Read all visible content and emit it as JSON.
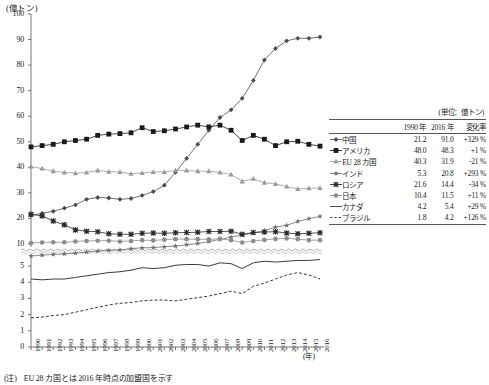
{
  "axis": {
    "unit_top": "(億トン)",
    "unit_year": "(年)",
    "y_main_ticks": [
      100,
      90,
      80,
      70,
      60,
      50,
      40,
      30,
      20,
      10
    ],
    "y_lower_ticks": [
      5,
      4,
      3,
      2,
      1,
      0
    ],
    "x_ticks": [
      "1990",
      "1991",
      "1992",
      "1993",
      "1994",
      "1995",
      "1996",
      "1997",
      "1998",
      "1999",
      "2000",
      "2001",
      "2002",
      "2003",
      "2004",
      "2005",
      "2006",
      "2007",
      "2008",
      "2009",
      "2010",
      "2011",
      "2012",
      "2013",
      "2014",
      "2015",
      "2016"
    ]
  },
  "footnote": {
    "mark": "(注)",
    "text": "EU 28 カ国とは 2016 年時点の加盟国を示す"
  },
  "legend": {
    "unit": "(単位：億トン)",
    "headers": [
      "",
      "",
      "1990 年",
      "2016 年",
      "変化率"
    ],
    "rows": [
      {
        "marker": "diamond",
        "name": "中国",
        "v1990": "21.2",
        "v2016": "91.0",
        "change": "+329 %"
      },
      {
        "marker": "square",
        "name": "アメリカ",
        "v1990": "48.0",
        "v2016": "48.3",
        "change": "+1 %"
      },
      {
        "marker": "triangle",
        "name": "EU 28 カ国",
        "v1990": "40.3",
        "v2016": "31.9",
        "change": "-21 %"
      },
      {
        "marker": "star",
        "name": "インド",
        "v1990": "5.3",
        "v2016": "20.8",
        "change": "+293 %"
      },
      {
        "marker": "cross",
        "name": "ロシア",
        "v1990": "21.6",
        "v2016": "14.4",
        "change": "-34 %"
      },
      {
        "marker": "circle",
        "name": "日本",
        "v1990": "10.4",
        "v2016": "11.5",
        "change": "+11 %"
      },
      {
        "marker": "solid",
        "name": "カナダ",
        "v1990": "4.2",
        "v2016": "5.4",
        "change": "+29 %"
      },
      {
        "marker": "dashed",
        "name": "ブラジル",
        "v1990": "1.8",
        "v2016": "4.2",
        "change": "+126 %"
      }
    ]
  },
  "colors": {
    "axis": "#555555",
    "china": "#4d4d4d",
    "usa": "#1a1a1a",
    "eu": "#9a9a9a",
    "india": "#6e6e6e",
    "russia": "#2b2b2b",
    "japan": "#8c8c8c",
    "canada": "#3a3a3a",
    "brazil": "#3a3a3a"
  },
  "chart_data": {
    "type": "line",
    "title": "",
    "xlabel": "(年)",
    "ylabel": "(億トン)",
    "ylim_main": [
      10,
      100
    ],
    "ylim_lower": [
      0,
      5.5
    ],
    "axis_break": true,
    "grid": false,
    "legend_position": "right",
    "x": [
      1990,
      1991,
      1992,
      1993,
      1994,
      1995,
      1996,
      1997,
      1998,
      1999,
      2000,
      2001,
      2002,
      2003,
      2004,
      2005,
      2006,
      2007,
      2008,
      2009,
      2010,
      2011,
      2012,
      2013,
      2014,
      2015,
      2016
    ],
    "series": [
      {
        "name": "中国",
        "marker": "diamond",
        "panel": "main",
        "values": [
          21.2,
          22.0,
          22.8,
          24.0,
          25.3,
          27.5,
          28.2,
          28.0,
          27.5,
          27.8,
          29.0,
          30.5,
          33.0,
          38.0,
          43.5,
          49.0,
          54.5,
          59.5,
          62.5,
          67.0,
          74.0,
          82.0,
          86.5,
          89.5,
          90.5,
          90.5,
          91.0
        ]
      },
      {
        "name": "アメリカ",
        "marker": "square",
        "panel": "main",
        "values": [
          48.0,
          48.5,
          49.0,
          50.0,
          50.5,
          51.0,
          52.5,
          53.0,
          53.2,
          53.5,
          55.5,
          54.0,
          54.3,
          55.0,
          55.8,
          56.5,
          55.8,
          56.5,
          54.5,
          50.5,
          52.5,
          51.0,
          48.5,
          50.0,
          50.2,
          49.0,
          48.3
        ]
      },
      {
        "name": "EU 28 カ国",
        "marker": "triangle",
        "panel": "main",
        "values": [
          40.3,
          39.5,
          38.5,
          38.0,
          37.7,
          38.0,
          38.8,
          38.3,
          38.2,
          37.5,
          37.8,
          38.2,
          38.2,
          38.8,
          38.8,
          38.5,
          38.5,
          38.0,
          37.2,
          34.5,
          35.5,
          34.0,
          33.5,
          32.5,
          31.5,
          31.8,
          31.9
        ]
      },
      {
        "name": "インド",
        "marker": "star",
        "panel": "main",
        "values": [
          5.3,
          5.6,
          5.9,
          6.1,
          6.4,
          6.8,
          7.2,
          7.5,
          7.7,
          8.2,
          8.5,
          8.6,
          8.9,
          9.2,
          9.7,
          10.2,
          10.9,
          11.8,
          12.7,
          13.5,
          14.3,
          15.2,
          16.6,
          17.3,
          18.8,
          19.9,
          20.8
        ]
      },
      {
        "name": "ロシア",
        "marker": "cross",
        "panel": "main",
        "values": [
          21.6,
          21.0,
          19.0,
          17.5,
          15.5,
          15.0,
          14.8,
          14.0,
          13.8,
          13.8,
          14.2,
          14.3,
          14.2,
          14.4,
          14.5,
          14.6,
          14.9,
          14.9,
          15.0,
          13.8,
          14.5,
          14.7,
          14.8,
          14.3,
          14.0,
          14.2,
          14.4
        ]
      },
      {
        "name": "日本",
        "marker": "circle",
        "panel": "main",
        "values": [
          10.4,
          10.6,
          10.7,
          10.7,
          11.0,
          11.2,
          11.3,
          11.3,
          11.0,
          11.2,
          11.5,
          11.4,
          11.7,
          11.9,
          11.9,
          11.9,
          11.8,
          12.0,
          11.5,
          10.6,
          11.2,
          11.6,
          12.0,
          12.2,
          11.9,
          11.5,
          11.5
        ]
      },
      {
        "name": "カナダ",
        "marker": "solid-line",
        "panel": "lower",
        "values": [
          4.2,
          4.15,
          4.2,
          4.2,
          4.3,
          4.4,
          4.5,
          4.6,
          4.65,
          4.75,
          4.9,
          4.85,
          4.9,
          5.05,
          5.1,
          5.1,
          5.0,
          5.2,
          5.15,
          4.85,
          5.2,
          5.3,
          5.25,
          5.3,
          5.35,
          5.35,
          5.4
        ]
      },
      {
        "name": "ブラジル",
        "marker": "dashed-line",
        "panel": "lower",
        "values": [
          1.8,
          1.85,
          1.95,
          2.0,
          2.15,
          2.3,
          2.45,
          2.6,
          2.7,
          2.75,
          2.85,
          2.9,
          2.9,
          2.85,
          2.95,
          3.05,
          3.15,
          3.3,
          3.45,
          3.3,
          3.75,
          3.95,
          4.2,
          4.45,
          4.6,
          4.45,
          4.2
        ]
      }
    ]
  }
}
